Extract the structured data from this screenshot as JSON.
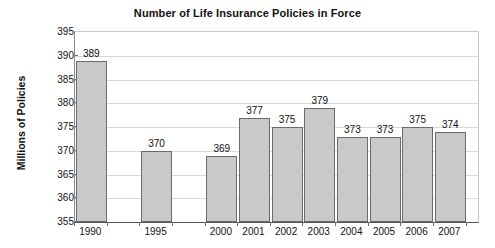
{
  "chart_data": {
    "type": "bar",
    "title": "Number of Life Insurance Policies in Force",
    "xlabel": "",
    "ylabel": "Millions of Policies",
    "categories": [
      "1990",
      "1995",
      "2000",
      "2001",
      "2002",
      "2003",
      "2004",
      "2005",
      "2006",
      "2007"
    ],
    "values": [
      389,
      370,
      369,
      377,
      375,
      379,
      373,
      373,
      375,
      374
    ],
    "value_labels": [
      "389",
      "370",
      "369",
      "377",
      "375",
      "379",
      "373",
      "373",
      "375",
      "374"
    ],
    "ylim": [
      355,
      395
    ],
    "ytick_step": 5,
    "ytick_labels": [
      "395",
      "390",
      "385",
      "380",
      "375",
      "370",
      "365",
      "360",
      "355"
    ],
    "ytick_values": [
      395,
      390,
      385,
      380,
      375,
      370,
      365,
      360,
      355
    ],
    "grid": true,
    "legend": false,
    "legend_position": "none",
    "bar_fill_color": "#c9c9c9",
    "bar_border_color": "#6b6b6b",
    "background_color": "#ffffff",
    "gridline_color": "#d8d8d8"
  }
}
